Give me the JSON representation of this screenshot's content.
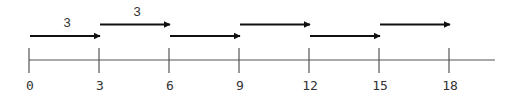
{
  "diagram": {
    "type": "number-line-skip-counting",
    "axis": {
      "start": 0,
      "end": 18,
      "step": 3,
      "ticks": [
        "0",
        "3",
        "6",
        "9",
        "12",
        "15",
        "18"
      ],
      "color": "#555555"
    },
    "jumps": [
      {
        "from": 0,
        "to": 3,
        "row": "low",
        "label": "3"
      },
      {
        "from": 3,
        "to": 6,
        "row": "high",
        "label": "3"
      },
      {
        "from": 6,
        "to": 9,
        "row": "low",
        "label": ""
      },
      {
        "from": 9,
        "to": 12,
        "row": "high",
        "label": ""
      },
      {
        "from": 12,
        "to": 15,
        "row": "low",
        "label": ""
      },
      {
        "from": 15,
        "to": 18,
        "row": "high",
        "label": ""
      }
    ],
    "arrow_color": "#111111"
  }
}
